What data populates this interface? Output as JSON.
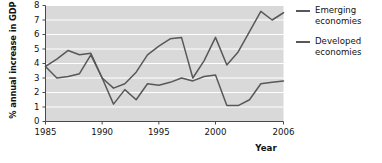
{
  "chart_data": {
    "type": "line",
    "title": "",
    "xlabel": "Year",
    "ylabel": "% annual increase in GDP",
    "xlim": [
      1985,
      2006
    ],
    "ylim": [
      0,
      8
    ],
    "yticks": [
      0,
      1,
      2,
      3,
      4,
      5,
      6,
      7,
      8
    ],
    "xticks": [
      1985,
      1990,
      1995,
      2000,
      2006
    ],
    "grid": true,
    "grid_axis": "y",
    "plot_background": "#d9d9d9",
    "gridline_color": "#ffffff",
    "line_color": "#58585a",
    "legend_position": "right",
    "x": [
      1985,
      1986,
      1987,
      1988,
      1989,
      1990,
      1991,
      1992,
      1993,
      1994,
      1995,
      1996,
      1997,
      1998,
      1999,
      2000,
      2001,
      2002,
      2003,
      2004,
      2005,
      2006
    ],
    "series": [
      {
        "name": "Emerging economies",
        "values": [
          3.8,
          4.3,
          4.9,
          4.6,
          4.7,
          3.0,
          2.3,
          2.6,
          3.4,
          4.6,
          5.2,
          5.7,
          5.8,
          3.0,
          4.2,
          5.8,
          3.9,
          4.8,
          6.2,
          7.6,
          7.0,
          7.5
        ]
      },
      {
        "name": "Developed economies",
        "values": [
          3.8,
          3.0,
          3.1,
          3.3,
          4.6,
          3.0,
          1.2,
          2.2,
          1.5,
          2.6,
          2.5,
          2.7,
          3.0,
          2.8,
          3.1,
          3.2,
          1.1,
          1.1,
          1.5,
          2.6,
          2.7,
          2.8
        ]
      }
    ]
  },
  "axes": {
    "ylabel_text": "% annual increase in GDP",
    "xlabel_text": "Year",
    "ytick_labels": [
      "8",
      "7",
      "6",
      "5",
      "4",
      "3",
      "2",
      "1",
      "0"
    ],
    "xtick_labels": [
      "1985",
      "1990",
      "1995",
      "2000",
      "2006"
    ]
  },
  "legend": {
    "items": [
      {
        "label": "Emerging\neconomies"
      },
      {
        "label": "Developed\neconomies"
      }
    ]
  }
}
